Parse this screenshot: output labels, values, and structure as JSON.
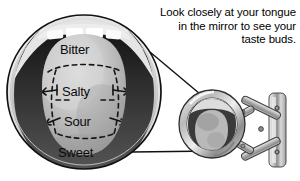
{
  "image": {
    "title": "Taste bud regions of the tongue with extendable mirror",
    "background_color": "#ffffff",
    "width": 300,
    "height": 181
  },
  "caption": {
    "text": "Look closely at your tongue in the mirror to see your taste buds.",
    "align": "right",
    "color": "#000000"
  },
  "magnified_view": {
    "name": "magnified-mouth-circle",
    "description": "Large circular magnified view of an open mouth showing the tongue",
    "outline_color": "#111111",
    "mouth_interior_color": "#2b2b2b",
    "tongue_color": "#bdbdbd",
    "teeth_color": "#f2f2f2"
  },
  "taste_zones": [
    {
      "id": "bitter",
      "label": "Bitter",
      "position": "back"
    },
    {
      "id": "salty",
      "label": "Salty",
      "position": "upper-sides"
    },
    {
      "id": "sour",
      "label": "Sour",
      "position": "lower-sides"
    },
    {
      "id": "sweet",
      "label": "Sweet",
      "position": "tip"
    }
  ],
  "mirror": {
    "name": "extendable-wall-mirror",
    "description": "Round wall-mounted mirror on a folding scissor arm reflecting the tongue",
    "frame_color": "#9a9a9a",
    "glass_color": "#cfcfcf",
    "arm_color": "#a8a8a8",
    "wall_plate_color": "#b5b5b5"
  },
  "magnifier_lines": {
    "name": "magnification-guide-lines",
    "color": "#1a1a1a",
    "count": 2
  }
}
